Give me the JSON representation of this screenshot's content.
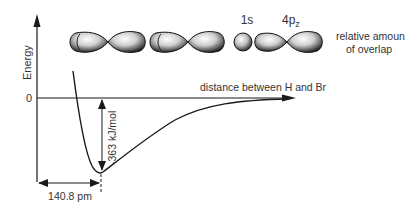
{
  "diagram": {
    "y_axis": {
      "label": "Energy",
      "zero_label": "0"
    },
    "x_axis": {
      "label": "distance between H and Br"
    },
    "orbital_labels": {
      "s": "1s",
      "p_main": "4p",
      "p_sub": "z"
    },
    "overlap_label": {
      "line1": "relative amoun",
      "line2": "of overlap"
    },
    "bond_energy_label": "-363 kJ/mol",
    "bond_length_label": "140.8 pm",
    "orbital_stages": [
      {
        "name": "far-apart",
        "description": "separate 1s and 4pz orbitals"
      },
      {
        "name": "approaching",
        "description": "orbitals beginning to overlap"
      },
      {
        "name": "bonded",
        "description": "1s overlapping 4pz"
      }
    ],
    "colors": {
      "line": "#1a1a1a",
      "orbital_dark": "#111111",
      "orbital_light": "#f2f2f2"
    }
  }
}
